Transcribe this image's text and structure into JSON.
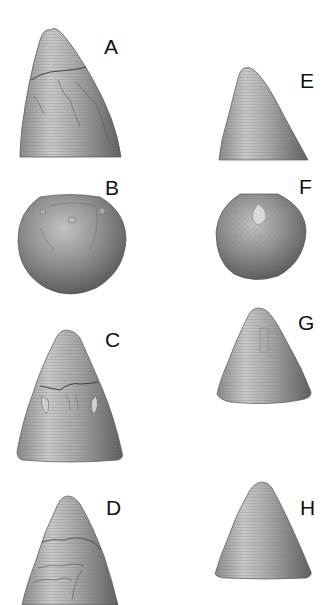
{
  "figure": {
    "panels": [
      {
        "id": "A",
        "label": "A",
        "view": "lateral",
        "shape": "cone-oblique",
        "feature": "broken enamel with cracks"
      },
      {
        "id": "B",
        "label": "B",
        "view": "apical",
        "shape": "dome",
        "feature": "apex with small tip"
      },
      {
        "id": "C",
        "label": "C",
        "view": "lateral",
        "shape": "cone",
        "feature": "growth lines with wear band"
      },
      {
        "id": "D",
        "label": "D",
        "view": "lateral",
        "shape": "cone-elongate",
        "feature": "cracked surface"
      },
      {
        "id": "E",
        "label": "E",
        "view": "lateral",
        "shape": "cone-oblique",
        "feature": "fine growth lines"
      },
      {
        "id": "F",
        "label": "F",
        "view": "apical",
        "shape": "dome",
        "feature": "concentric rings"
      },
      {
        "id": "G",
        "label": "G",
        "view": "lateral",
        "shape": "cone",
        "feature": "fine growth lines"
      },
      {
        "id": "H",
        "label": "H",
        "view": "lateral",
        "shape": "cone",
        "feature": "fine growth lines"
      }
    ],
    "colors": {
      "background": "#ffffff",
      "specimen_light": "#d8d8d8",
      "specimen_mid": "#9a9a9a",
      "specimen_dark": "#4a4a4a",
      "label": "#111111"
    }
  }
}
